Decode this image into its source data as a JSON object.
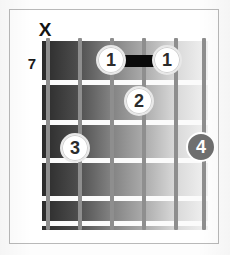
{
  "diagram": {
    "fret_number_label": "7",
    "open_string_markers": [
      {
        "string": 1,
        "symbol": "X",
        "meaning": "muted"
      }
    ],
    "frame_color": "#b9b9b9",
    "string_color": "#8e8e8e",
    "fret_color": "#fbfbfb",
    "barre_color": "#0a0a0a",
    "dot_light_fill": "#ffffff",
    "dot_light_text": "#2b2b2b",
    "dot_dark_fill": "#6f6f6f",
    "dot_dark_text": "#ffffff",
    "strings": [
      {
        "index": 1,
        "x": 46,
        "shade": "#2a2a2a"
      },
      {
        "index": 2,
        "x": 78,
        "shade": "#4a4a4a"
      },
      {
        "index": 3,
        "x": 110,
        "shade": "#7e7e7e"
      },
      {
        "index": 4,
        "x": 142,
        "shade": "#a8a8a8"
      },
      {
        "index": 5,
        "x": 174,
        "shade": "#d8d8d8"
      },
      {
        "index": 6,
        "x": 202,
        "shade": "#f2f2f2"
      }
    ],
    "frets": [
      {
        "index": 0,
        "y": 38,
        "nut": true
      },
      {
        "index": 1,
        "y": 80
      },
      {
        "index": 2,
        "y": 120
      },
      {
        "index": 3,
        "y": 158
      },
      {
        "index": 4,
        "y": 196
      },
      {
        "index": 5,
        "y": 221
      }
    ],
    "barres": [
      {
        "name": "barre-fret1",
        "label": "1",
        "from_string": 3,
        "to_string": 5,
        "fret": 1,
        "x": 118,
        "y": 55,
        "width": 44,
        "height": 12
      }
    ],
    "fingers": [
      {
        "name": "finger-1-string-3",
        "label": "1",
        "string": 3,
        "fret": 1,
        "style": "light",
        "x": 96,
        "y": 45
      },
      {
        "name": "finger-1-string-5",
        "label": "1",
        "string": 5,
        "fret": 1,
        "style": "light",
        "x": 152,
        "y": 45
      },
      {
        "name": "finger-2-string-4",
        "label": "2",
        "string": 4,
        "fret": 2,
        "style": "light",
        "x": 124,
        "y": 86
      },
      {
        "name": "finger-3-string-2",
        "label": "3",
        "string": 2,
        "fret": 3,
        "style": "light",
        "x": 60,
        "y": 133
      },
      {
        "name": "finger-4-string-6",
        "label": "4",
        "string": 6,
        "fret": 3,
        "style": "dark",
        "x": 186,
        "y": 132
      }
    ]
  }
}
